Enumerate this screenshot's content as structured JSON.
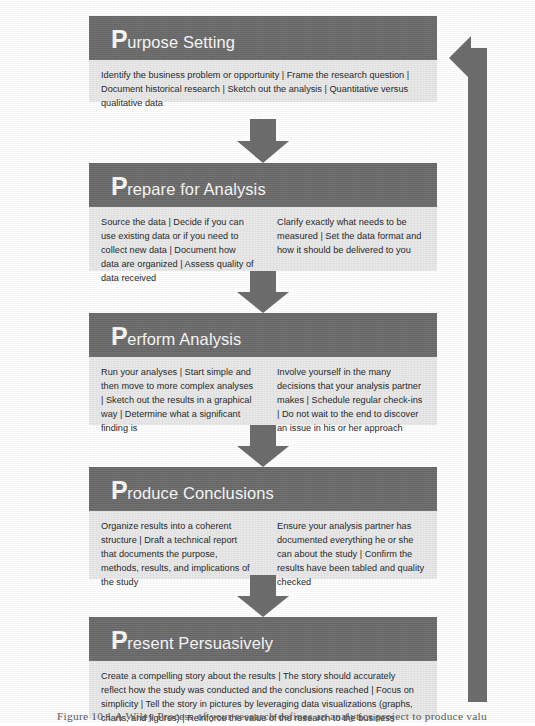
{
  "figure": {
    "type": "process-flow-diagram",
    "orientation": "vertical",
    "caption": "Figure 10.1  A Wiley Process of your research defines an analytics project to produce value",
    "colors": {
      "header_bg": "#6e6e6e",
      "body_bg": "#e9e9e9",
      "arrow": "#6e6e6e",
      "header_text": "#ffffff",
      "body_text": "#2a2a2a",
      "page_bg": "#ffffff"
    }
  },
  "stages": [
    {
      "id": "purpose-setting",
      "drop_cap": "P",
      "title_rest": "urpose Setting",
      "title_full": "Purpose Setting",
      "columns": [
        "Identify the business problem or opportunity | Frame the research question | Document historical research | Sketch out the analysis | Quantitative versus qualitative data"
      ]
    },
    {
      "id": "prepare-for-analysis",
      "drop_cap": "P",
      "title_rest": "repare for Analysis",
      "title_full": "Prepare for Analysis",
      "columns": [
        "Source the data | Decide if you can use existing data or if you need to collect new data | Document how data are organized | Assess quality of data received",
        "Clarify exactly what needs to be measured | Set the data format and how it should be delivered to you"
      ]
    },
    {
      "id": "perform-analysis",
      "drop_cap": "P",
      "title_rest": "erform Analysis",
      "title_full": "Perform Analysis",
      "columns": [
        "Run your analyses | Start simple and then move to more complex analyses | Sketch out the results in a graphical way | Determine what a significant finding is",
        "Involve yourself in the many decisions that your analysis partner makes | Schedule regular check-ins | Do not wait to the end to discover an issue in his or her approach"
      ]
    },
    {
      "id": "produce-conclusions",
      "drop_cap": "P",
      "title_rest": "roduce Conclusions",
      "title_full": "Produce Conclusions",
      "columns": [
        "Organize results into a coherent structure | Draft a technical report that documents the purpose, methods, results, and implications of the study",
        "Ensure your analysis partner has documented everything he or she can about the study | Confirm the results have been tabled and quality checked"
      ]
    },
    {
      "id": "present-persuasively",
      "drop_cap": "P",
      "title_rest": "resent Persuasively",
      "title_full": "Present Persuasively",
      "columns": [
        "Create a compelling story about the results | The story should accurately reflect how the study was conducted and the conclusions reached | Focus on simplicity | Tell the story in pictures by leveraging data visualizations (graphs, charts, and figures) | Reinforce the value of the research to the business"
      ]
    }
  ],
  "connectors": {
    "down_arrow_label": "proceeds to next stage",
    "feedback_arrow_label": "feedback loop back to Purpose Setting"
  }
}
